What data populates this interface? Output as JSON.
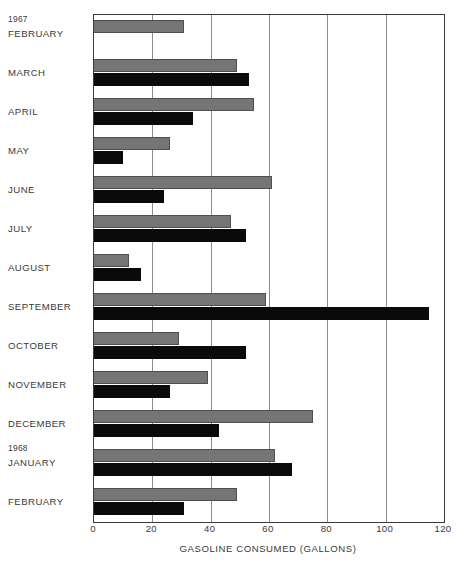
{
  "chart_data": {
    "type": "bar",
    "orientation": "horizontal",
    "title": "",
    "xlabel": "GASOLINE CONSUMED (GALLONS)",
    "ylabel": "",
    "xlim": [
      0,
      120
    ],
    "xticks": [
      0,
      20,
      40,
      60,
      80,
      100,
      120
    ],
    "xtick_labels": [
      "0",
      "20",
      "40",
      "60",
      "80",
      "100",
      "120"
    ],
    "grid": "vertical",
    "legend": "none",
    "categories": [
      "FEBRUARY",
      "MARCH",
      "APRIL",
      "MAY",
      "JUNE",
      "JULY",
      "AUGUST",
      "SEPTEMBER",
      "OCTOBER",
      "NOVEMBER",
      "DECEMBER",
      "JANUARY",
      "FEBRUARY"
    ],
    "group_headers": [
      {
        "label": "1967",
        "before_category_index": 0
      },
      {
        "label": "1968",
        "before_category_index": 11
      }
    ],
    "series": [
      {
        "name": "gray-series",
        "color": "#757575",
        "values": [
          31,
          49,
          55,
          26,
          61,
          47,
          12,
          59,
          29,
          39,
          75,
          62,
          49
        ]
      },
      {
        "name": "black-series",
        "color": "#0a0a0a",
        "values": [
          null,
          53,
          34,
          10,
          24,
          52,
          16,
          115,
          52,
          26,
          43,
          68,
          31
        ]
      }
    ]
  },
  "axis": {
    "frame_color": "#3a3a3a",
    "gridline_color": "#8e8e8e"
  }
}
